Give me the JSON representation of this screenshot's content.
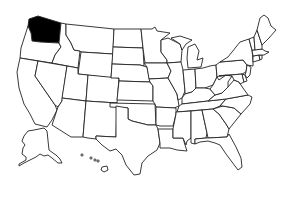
{
  "map": {
    "title": "United States map",
    "highlighted_state": "Washington",
    "highlight_color": "#000000",
    "fill_color": "#ffffff",
    "stroke_color": "#222222",
    "states": [
      {
        "id": "WA",
        "name": "Washington",
        "highlighted": true
      },
      {
        "id": "OR",
        "name": "Oregon",
        "highlighted": false
      },
      {
        "id": "CA",
        "name": "California",
        "highlighted": false
      },
      {
        "id": "ID",
        "name": "Idaho",
        "highlighted": false
      },
      {
        "id": "NV",
        "name": "Nevada",
        "highlighted": false
      },
      {
        "id": "MT",
        "name": "Montana",
        "highlighted": false
      },
      {
        "id": "WY",
        "name": "Wyoming",
        "highlighted": false
      },
      {
        "id": "UT",
        "name": "Utah",
        "highlighted": false
      },
      {
        "id": "AZ",
        "name": "Arizona",
        "highlighted": false
      },
      {
        "id": "CO",
        "name": "Colorado",
        "highlighted": false
      },
      {
        "id": "NM",
        "name": "New Mexico",
        "highlighted": false
      },
      {
        "id": "ND",
        "name": "North Dakota",
        "highlighted": false
      },
      {
        "id": "SD",
        "name": "South Dakota",
        "highlighted": false
      },
      {
        "id": "NE",
        "name": "Nebraska",
        "highlighted": false
      },
      {
        "id": "KS",
        "name": "Kansas",
        "highlighted": false
      },
      {
        "id": "OK",
        "name": "Oklahoma",
        "highlighted": false
      },
      {
        "id": "TX",
        "name": "Texas",
        "highlighted": false
      },
      {
        "id": "MN",
        "name": "Minnesota",
        "highlighted": false
      },
      {
        "id": "IA",
        "name": "Iowa",
        "highlighted": false
      },
      {
        "id": "MO",
        "name": "Missouri",
        "highlighted": false
      },
      {
        "id": "AR",
        "name": "Arkansas",
        "highlighted": false
      },
      {
        "id": "LA",
        "name": "Louisiana",
        "highlighted": false
      },
      {
        "id": "WI",
        "name": "Wisconsin",
        "highlighted": false
      },
      {
        "id": "IL",
        "name": "Illinois",
        "highlighted": false
      },
      {
        "id": "MI",
        "name": "Michigan",
        "highlighted": false
      },
      {
        "id": "IN",
        "name": "Indiana",
        "highlighted": false
      },
      {
        "id": "OH",
        "name": "Ohio",
        "highlighted": false
      },
      {
        "id": "KY",
        "name": "Kentucky",
        "highlighted": false
      },
      {
        "id": "TN",
        "name": "Tennessee",
        "highlighted": false
      },
      {
        "id": "MS",
        "name": "Mississippi",
        "highlighted": false
      },
      {
        "id": "AL",
        "name": "Alabama",
        "highlighted": false
      },
      {
        "id": "GA",
        "name": "Georgia",
        "highlighted": false
      },
      {
        "id": "FL",
        "name": "Florida",
        "highlighted": false
      },
      {
        "id": "SC",
        "name": "South Carolina",
        "highlighted": false
      },
      {
        "id": "NC",
        "name": "North Carolina",
        "highlighted": false
      },
      {
        "id": "VA",
        "name": "Virginia",
        "highlighted": false
      },
      {
        "id": "WV",
        "name": "West Virginia",
        "highlighted": false
      },
      {
        "id": "PA",
        "name": "Pennsylvania",
        "highlighted": false
      },
      {
        "id": "NY",
        "name": "New York",
        "highlighted": false
      },
      {
        "id": "MD",
        "name": "Maryland",
        "highlighted": false
      },
      {
        "id": "DE",
        "name": "Delaware",
        "highlighted": false
      },
      {
        "id": "NJ",
        "name": "New Jersey",
        "highlighted": false
      },
      {
        "id": "CT",
        "name": "Connecticut",
        "highlighted": false
      },
      {
        "id": "RI",
        "name": "Rhode Island",
        "highlighted": false
      },
      {
        "id": "MA",
        "name": "Massachusetts",
        "highlighted": false
      },
      {
        "id": "VT",
        "name": "Vermont",
        "highlighted": false
      },
      {
        "id": "NH",
        "name": "New Hampshire",
        "highlighted": false
      },
      {
        "id": "ME",
        "name": "Maine",
        "highlighted": false
      },
      {
        "id": "AK",
        "name": "Alaska",
        "highlighted": false
      },
      {
        "id": "HI",
        "name": "Hawaii",
        "highlighted": false
      }
    ]
  }
}
